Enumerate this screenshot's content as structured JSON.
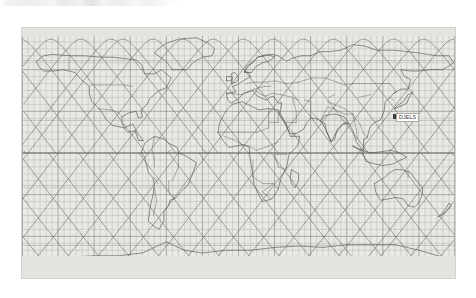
{
  "window": {
    "title": "Satellite Ground Track Map",
    "toolbar_visible": true
  },
  "map": {
    "projection": "equirectangular",
    "background_color": "#e8e8e4",
    "grid_color": "#b4b4ae",
    "major_grid_color": "#8f8f89",
    "coastline_color": "#3c3c3c",
    "border_color": "#5a5a5a",
    "track_color": "#55555a",
    "lon_range": [
      -180,
      180
    ],
    "lat_range": [
      -90,
      90
    ],
    "grid_step_deg": 5,
    "major_grid_step_deg": 30
  },
  "satellite_label": {
    "name": "DJELS",
    "marker": "satellite-marker"
  },
  "chart_data": {
    "type": "line",
    "xlabel": "Longitude (deg)",
    "ylabel": "Latitude (deg)",
    "xlim": [
      -180,
      180
    ],
    "ylim": [
      -90,
      90
    ],
    "grid": true,
    "legend": "none",
    "series": [
      {
        "name": "pass-1",
        "phase_deg": -175,
        "inclination_deg": 82
      },
      {
        "name": "pass-2",
        "phase_deg": -150,
        "inclination_deg": 82
      },
      {
        "name": "pass-3",
        "phase_deg": -125,
        "inclination_deg": 82
      },
      {
        "name": "pass-4",
        "phase_deg": -100,
        "inclination_deg": 82
      },
      {
        "name": "pass-5",
        "phase_deg": -75,
        "inclination_deg": 82
      },
      {
        "name": "pass-6",
        "phase_deg": -50,
        "inclination_deg": 82
      },
      {
        "name": "pass-7",
        "phase_deg": -25,
        "inclination_deg": 82
      },
      {
        "name": "pass-8",
        "phase_deg": 0,
        "inclination_deg": 82
      },
      {
        "name": "pass-9",
        "phase_deg": 25,
        "inclination_deg": 82
      },
      {
        "name": "pass-10",
        "phase_deg": 50,
        "inclination_deg": 82
      },
      {
        "name": "pass-11",
        "phase_deg": 75,
        "inclination_deg": 82
      },
      {
        "name": "pass-12",
        "phase_deg": 100,
        "inclination_deg": 82
      },
      {
        "name": "pass-13",
        "phase_deg": 125,
        "inclination_deg": 82
      },
      {
        "name": "pass-14",
        "phase_deg": 150,
        "inclination_deg": 82
      },
      {
        "name": "pass-15",
        "phase_deg": 175,
        "inclination_deg": 82
      }
    ]
  }
}
